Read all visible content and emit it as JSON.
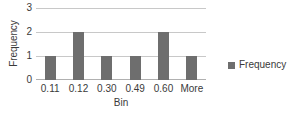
{
  "chart_data": {
    "type": "bar",
    "title": "",
    "subtitle": "",
    "categories": [
      "0.11",
      "0.12",
      "0.30",
      "0.49",
      "0.60",
      "More"
    ],
    "values": [
      1,
      2,
      1,
      1,
      2,
      1
    ],
    "series": [
      {
        "name": "Frequency",
        "values": [
          1,
          2,
          1,
          1,
          2,
          1
        ]
      }
    ],
    "xlabel": "Bin",
    "ylabel": "Frequency",
    "ylim": [
      0,
      3
    ],
    "yticks": [
      0,
      1,
      2,
      3
    ],
    "ytick_labels": [
      "0",
      "1",
      "2",
      "3"
    ],
    "grid": true,
    "grid_axis": "y",
    "legend": {
      "position": "right",
      "entries": [
        {
          "label": "Frequency",
          "color": "#6e6e6e",
          "marker": "square-swatch"
        }
      ]
    },
    "colors": {
      "bar": "#6e6e6e",
      "gridline": "#c8c8c8",
      "axis": "#b0b0b0",
      "text": "#3a3a3a",
      "background": "#ffffff"
    }
  }
}
